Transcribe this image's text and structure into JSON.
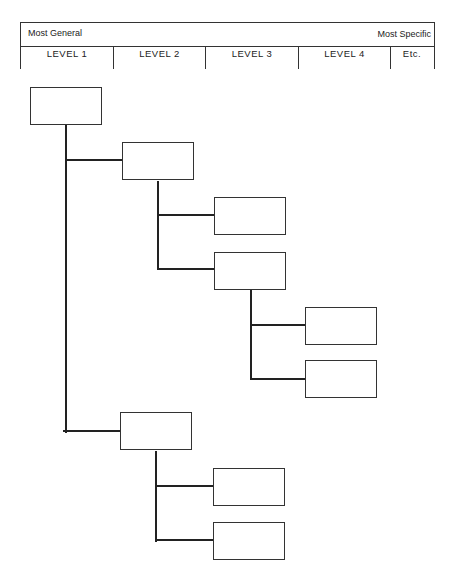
{
  "header": {
    "left_label": "Most General",
    "right_label": "Most Specific",
    "levels": [
      "LEVEL 1",
      "LEVEL 2",
      "LEVEL 3",
      "LEVEL 4",
      "Etc."
    ]
  },
  "tree": {
    "nodes": [
      {
        "id": "n1",
        "level": 1,
        "label": ""
      },
      {
        "id": "n2",
        "level": 2,
        "parent": "n1",
        "label": ""
      },
      {
        "id": "n3",
        "level": 3,
        "parent": "n2",
        "label": ""
      },
      {
        "id": "n4",
        "level": 3,
        "parent": "n2",
        "label": ""
      },
      {
        "id": "n5",
        "level": 4,
        "parent": "n4",
        "label": ""
      },
      {
        "id": "n6",
        "level": 4,
        "parent": "n4",
        "label": ""
      },
      {
        "id": "n7",
        "level": 2,
        "parent": "n1",
        "label": ""
      },
      {
        "id": "n8",
        "level": 3,
        "parent": "n7",
        "label": ""
      },
      {
        "id": "n9",
        "level": 3,
        "parent": "n7",
        "label": ""
      }
    ]
  }
}
